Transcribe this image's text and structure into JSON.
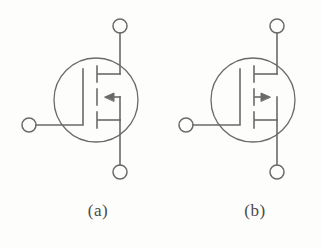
{
  "figure": {
    "kind": "circuit-symbol-figure",
    "background_color": "#fdfdfb",
    "line_color": "#6a6a6a",
    "label_color": "#4a4a4a",
    "stroke_width": 1.6
  },
  "symbols": [
    {
      "id": "a",
      "label": "(a)",
      "device": "mosfet",
      "channel": "n-channel",
      "arrow_direction": "left",
      "arrow_name": "substrate-arrow-left",
      "origin_x": 0,
      "terminals": [
        {
          "name": "drain-terminal",
          "position": "top",
          "cx": 120,
          "cy": 26,
          "r": 7
        },
        {
          "name": "gate-terminal",
          "position": "left",
          "cx": 29,
          "cy": 125,
          "r": 7
        },
        {
          "name": "source-terminal",
          "position": "bottom",
          "cx": 120,
          "cy": 172,
          "r": 7
        }
      ],
      "enclosure": {
        "name": "device-envelope-circle",
        "cx": 96,
        "cy": 100,
        "r": 42
      },
      "channel_segments": [
        {
          "name": "channel-segment-top",
          "x": 97,
          "y1": 66,
          "y2": 82
        },
        {
          "name": "channel-segment-middle",
          "x": 97,
          "y1": 89,
          "y2": 105
        },
        {
          "name": "channel-segment-bottom",
          "x": 97,
          "y1": 112,
          "y2": 128
        }
      ]
    },
    {
      "id": "b",
      "label": "(b)",
      "device": "mosfet",
      "channel": "p-channel",
      "arrow_direction": "right",
      "arrow_name": "substrate-arrow-right",
      "origin_x": 157,
      "terminals": [
        {
          "name": "drain-terminal",
          "position": "top",
          "cx": 277,
          "cy": 26,
          "r": 7
        },
        {
          "name": "gate-terminal",
          "position": "left",
          "cx": 186,
          "cy": 125,
          "r": 7
        },
        {
          "name": "source-terminal",
          "position": "bottom",
          "cx": 277,
          "cy": 172,
          "r": 7
        }
      ],
      "enclosure": {
        "name": "device-envelope-circle",
        "cx": 253,
        "cy": 100,
        "r": 42
      },
      "channel_segments": [
        {
          "name": "channel-segment-top",
          "x": 254,
          "y1": 66,
          "y2": 82
        },
        {
          "name": "channel-segment-middle",
          "x": 254,
          "y1": 89,
          "y2": 105
        },
        {
          "name": "channel-segment-bottom",
          "x": 254,
          "y1": 112,
          "y2": 128
        }
      ]
    }
  ],
  "labels": {
    "a": "(a)",
    "b": "(b)"
  }
}
